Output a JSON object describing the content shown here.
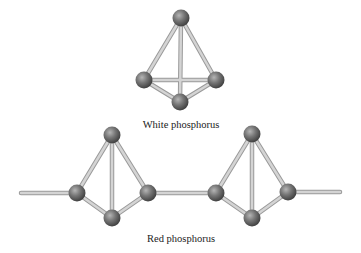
{
  "labels": {
    "white": "White phosphorus",
    "red": "Red phosphorus"
  },
  "colors": {
    "bond": "#c8c8c8",
    "bond_edge": "#9a9a9a",
    "atom_light": "#a8a8a8",
    "atom_mid": "#6e6e6e",
    "atom_dark": "#3c3c3c"
  }
}
